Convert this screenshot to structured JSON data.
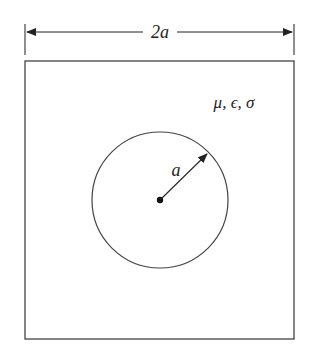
{
  "diagram": {
    "width_label": "2a",
    "radius_label": "a",
    "material_label": "μ, ϵ, σ"
  },
  "colors": {
    "stroke": "#444444",
    "background": "#ffffff"
  }
}
